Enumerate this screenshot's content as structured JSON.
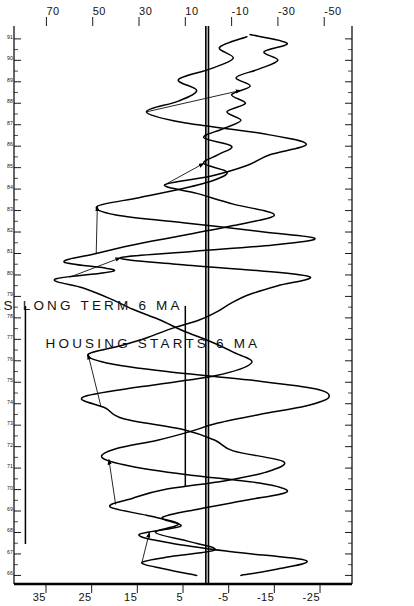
{
  "chart_data": {
    "type": "line",
    "title": "",
    "subtitle": "",
    "orientation": "rotated-90-ccw",
    "xlabel": "",
    "ylabel": "",
    "grid": false,
    "legend_position": "inside-left",
    "x": [
      66,
      67,
      68,
      69,
      70,
      71,
      72,
      73,
      74,
      75,
      76,
      77,
      78,
      79,
      80,
      81,
      82,
      83,
      84,
      85,
      86,
      87,
      88,
      89,
      90,
      91
    ],
    "xlim": [
      65.6,
      91.6
    ],
    "x_tick_labels": [
      "66",
      "67",
      "68",
      "69",
      "70",
      "71",
      "72",
      "73",
      "74",
      "75",
      "76",
      "77",
      "78",
      "79",
      "80",
      "81",
      "82",
      "83",
      "84",
      "85",
      "86",
      "87",
      "88",
      "89",
      "90",
      "91"
    ],
    "series": [
      {
        "name": "US TREAS LONG TERM 6 MA",
        "axis": "left",
        "axis_label": "US TREAS LONG TERM 6 MA",
        "tick_labels": [
          "35",
          "25",
          "15",
          "5",
          "-5",
          "-15",
          "-25"
        ],
        "tick_values": [
          35,
          25,
          15,
          5,
          -5,
          -15,
          -25
        ],
        "ylim": [
          -32,
          42
        ],
        "zero_line": 0,
        "color": "#000000",
        "values": [
          1,
          6,
          14,
          9,
          -3,
          -14,
          -9,
          11,
          20,
          12,
          2,
          -4,
          6,
          16,
          25,
          18,
          1,
          -13,
          -2,
          -8,
          -16,
          -5,
          1,
          10,
          2,
          -6
        ],
        "detailed_values": [
          {
            "t": 66.0,
            "v": 2
          },
          {
            "t": 66.3,
            "v": 9
          },
          {
            "t": 66.6,
            "v": 14
          },
          {
            "t": 66.9,
            "v": 7
          },
          {
            "t": 67.2,
            "v": -2
          },
          {
            "t": 67.6,
            "v": 4
          },
          {
            "t": 68.0,
            "v": 11
          },
          {
            "t": 68.4,
            "v": 6
          },
          {
            "t": 68.8,
            "v": 13
          },
          {
            "t": 69.2,
            "v": 21
          },
          {
            "t": 69.6,
            "v": 16
          },
          {
            "t": 70.0,
            "v": 9
          },
          {
            "t": 70.4,
            "v": -4
          },
          {
            "t": 70.8,
            "v": -13
          },
          {
            "t": 71.3,
            "v": -17
          },
          {
            "t": 71.8,
            "v": -6
          },
          {
            "t": 72.3,
            "v": -2
          },
          {
            "t": 72.8,
            "v": 5
          },
          {
            "t": 73.3,
            "v": 18
          },
          {
            "t": 73.8,
            "v": 22
          },
          {
            "t": 74.3,
            "v": 27
          },
          {
            "t": 74.8,
            "v": 14
          },
          {
            "t": 75.3,
            "v": -2
          },
          {
            "t": 75.9,
            "v": -10
          },
          {
            "t": 76.4,
            "v": -6
          },
          {
            "t": 76.9,
            "v": -1
          },
          {
            "t": 77.4,
            "v": 5
          },
          {
            "t": 77.9,
            "v": 10
          },
          {
            "t": 78.4,
            "v": 16
          },
          {
            "t": 78.9,
            "v": 21
          },
          {
            "t": 79.4,
            "v": 27
          },
          {
            "t": 79.8,
            "v": 33
          },
          {
            "t": 80.2,
            "v": 20
          },
          {
            "t": 80.6,
            "v": 31
          },
          {
            "t": 81.0,
            "v": 24
          },
          {
            "t": 81.4,
            "v": 16
          },
          {
            "t": 81.8,
            "v": 6
          },
          {
            "t": 82.3,
            "v": -6
          },
          {
            "t": 82.8,
            "v": -15
          },
          {
            "t": 83.3,
            "v": -6
          },
          {
            "t": 83.8,
            "v": 2
          },
          {
            "t": 84.2,
            "v": 9
          },
          {
            "t": 84.6,
            "v": -1
          },
          {
            "t": 85.1,
            "v": -9
          },
          {
            "t": 85.6,
            "v": -14
          },
          {
            "t": 86.1,
            "v": -22
          },
          {
            "t": 86.6,
            "v": -12
          },
          {
            "t": 87.1,
            "v": 5
          },
          {
            "t": 87.6,
            "v": 13
          },
          {
            "t": 88.1,
            "v": 6
          },
          {
            "t": 88.6,
            "v": 2
          },
          {
            "t": 89.1,
            "v": 6
          },
          {
            "t": 89.6,
            "v": -1
          },
          {
            "t": 90.1,
            "v": -6
          },
          {
            "t": 90.6,
            "v": -3
          },
          {
            "t": 91.1,
            "v": -9
          }
        ]
      },
      {
        "name": "HOUSING STARTS 6 MA",
        "axis": "right",
        "axis_label": "HOUSING STARTS 6 MA",
        "tick_labels": [
          "70",
          "50",
          "30",
          "10",
          "-10",
          "-30",
          "-50"
        ],
        "tick_values": [
          70,
          50,
          30,
          10,
          -10,
          -30,
          -50
        ],
        "ylim": [
          -62,
          84
        ],
        "zero_line": 0,
        "color": "#000000",
        "values": [
          -8,
          -22,
          8,
          28,
          -18,
          -38,
          30,
          52,
          4,
          -44,
          14,
          40,
          16,
          -12,
          -34,
          34,
          10,
          -24,
          18,
          -4,
          -12,
          -6,
          -16,
          -8,
          -20,
          -26
        ],
        "detailed_values": [
          {
            "t": 66.0,
            "v": -14
          },
          {
            "t": 66.3,
            "v": -30
          },
          {
            "t": 66.7,
            "v": -42
          },
          {
            "t": 67.1,
            "v": -10
          },
          {
            "t": 67.5,
            "v": 16
          },
          {
            "t": 67.9,
            "v": 30
          },
          {
            "t": 68.3,
            "v": 12
          },
          {
            "t": 68.7,
            "v": 20
          },
          {
            "t": 69.1,
            "v": 4
          },
          {
            "t": 69.5,
            "v": -16
          },
          {
            "t": 69.9,
            "v": -34
          },
          {
            "t": 70.3,
            "v": -22
          },
          {
            "t": 70.7,
            "v": 10
          },
          {
            "t": 71.1,
            "v": 34
          },
          {
            "t": 71.5,
            "v": 46
          },
          {
            "t": 71.9,
            "v": 40
          },
          {
            "t": 72.3,
            "v": 22
          },
          {
            "t": 72.7,
            "v": 8
          },
          {
            "t": 73.1,
            "v": -4
          },
          {
            "t": 73.5,
            "v": -22
          },
          {
            "t": 73.9,
            "v": -42
          },
          {
            "t": 74.3,
            "v": -52
          },
          {
            "t": 74.7,
            "v": -46
          },
          {
            "t": 75.1,
            "v": -18
          },
          {
            "t": 75.5,
            "v": 18
          },
          {
            "t": 75.9,
            "v": 44
          },
          {
            "t": 76.3,
            "v": 52
          },
          {
            "t": 76.7,
            "v": 38
          },
          {
            "t": 77.1,
            "v": 26
          },
          {
            "t": 77.5,
            "v": 16
          },
          {
            "t": 77.9,
            "v": 4
          },
          {
            "t": 78.3,
            "v": -4
          },
          {
            "t": 78.7,
            "v": -10
          },
          {
            "t": 79.1,
            "v": -18
          },
          {
            "t": 79.5,
            "v": -30
          },
          {
            "t": 79.9,
            "v": -44
          },
          {
            "t": 80.2,
            "v": -22
          },
          {
            "t": 80.5,
            "v": 14
          },
          {
            "t": 80.8,
            "v": 38
          },
          {
            "t": 81.1,
            "v": 6
          },
          {
            "t": 81.4,
            "v": -28
          },
          {
            "t": 81.7,
            "v": -46
          },
          {
            "t": 82.0,
            "v": -24
          },
          {
            "t": 82.4,
            "v": 8
          },
          {
            "t": 82.8,
            "v": 40
          },
          {
            "t": 83.2,
            "v": 48
          },
          {
            "t": 83.6,
            "v": 30
          },
          {
            "t": 84.0,
            "v": 12
          },
          {
            "t": 84.4,
            "v": -2
          },
          {
            "t": 84.8,
            "v": -8
          },
          {
            "t": 85.2,
            "v": 2
          },
          {
            "t": 85.6,
            "v": -4
          },
          {
            "t": 86.0,
            "v": -10
          },
          {
            "t": 86.4,
            "v": 2
          },
          {
            "t": 86.8,
            "v": -6
          },
          {
            "t": 87.2,
            "v": -14
          },
          {
            "t": 87.6,
            "v": -8
          },
          {
            "t": 88.0,
            "v": -16
          },
          {
            "t": 88.4,
            "v": -10
          },
          {
            "t": 88.8,
            "v": -18
          },
          {
            "t": 89.2,
            "v": -12
          },
          {
            "t": 89.6,
            "v": -22
          },
          {
            "t": 90.0,
            "v": -30
          },
          {
            "t": 90.4,
            "v": -24
          },
          {
            "t": 90.8,
            "v": -34
          },
          {
            "t": 91.2,
            "v": -18
          }
        ]
      }
    ],
    "annotations": [
      {
        "label": "lead-arrow",
        "from_series": "US TREAS LONG TERM 6 MA",
        "to_series": "HOUSING STARTS 6 MA",
        "from_t": 66.6,
        "to_t": 68.0
      },
      {
        "label": "lead-arrow",
        "from_series": "US TREAS LONG TERM 6 MA",
        "to_series": "HOUSING STARTS 6 MA",
        "from_t": 69.3,
        "to_t": 71.4
      },
      {
        "label": "lead-arrow",
        "from_series": "US TREAS LONG TERM 6 MA",
        "to_series": "HOUSING STARTS 6 MA",
        "from_t": 73.9,
        "to_t": 76.3
      },
      {
        "label": "lead-arrow",
        "from_series": "US TREAS LONG TERM 6 MA",
        "to_series": "HOUSING STARTS 6 MA",
        "from_t": 79.9,
        "to_t": 80.8
      },
      {
        "label": "lead-arrow",
        "from_series": "US TREAS LONG TERM 6 MA",
        "to_series": "HOUSING STARTS 6 MA",
        "from_t": 81.0,
        "to_t": 83.2
      },
      {
        "label": "lead-arrow",
        "from_series": "US TREAS LONG TERM 6 MA",
        "to_series": "HOUSING STARTS 6 MA",
        "from_t": 84.2,
        "to_t": 85.2
      },
      {
        "label": "lead-arrow",
        "from_series": "US TREAS LONG TERM 6 MA",
        "to_series": "HOUSING STARTS 6 MA",
        "from_t": 87.6,
        "to_t": 88.6
      }
    ]
  },
  "legend": {
    "items": [
      {
        "label": "US TREAS LONG TERM 6 MA",
        "marker": "line-marker"
      },
      {
        "label": "HOUSING STARTS 6 MA",
        "marker": "line-marker"
      }
    ]
  },
  "axes": {
    "left_axis": {
      "name": "US TREAS LONG TERM 6 MA",
      "labels": [
        "35",
        "25",
        "15",
        "5",
        "-5",
        "-15",
        "-25"
      ]
    },
    "right_axis": {
      "name": "HOUSING STARTS 6 MA",
      "labels": [
        "70",
        "50",
        "30",
        "10",
        "-10",
        "-30",
        "-50"
      ]
    },
    "time_axis": {
      "labels": [
        "66",
        "67",
        "68",
        "69",
        "70",
        "71",
        "72",
        "73",
        "74",
        "75",
        "76",
        "77",
        "78",
        "79",
        "80",
        "81",
        "82",
        "83",
        "84",
        "85",
        "86",
        "87",
        "88",
        "89",
        "90",
        "91"
      ]
    }
  }
}
